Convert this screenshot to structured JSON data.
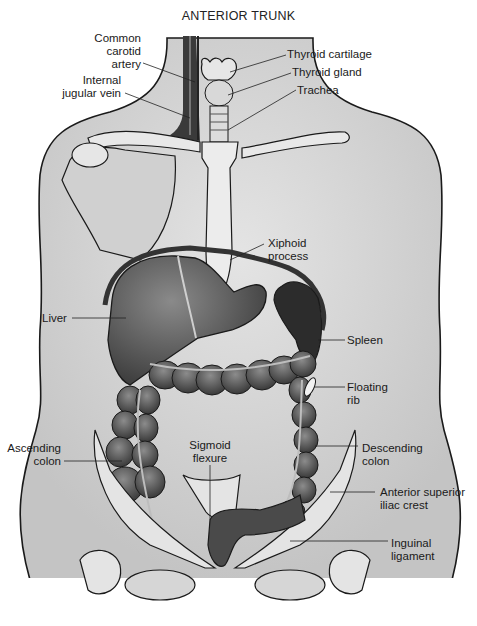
{
  "title": "ANTERIOR TRUNK",
  "labels": {
    "common_carotid_artery": "Common\ncarotid\nartery",
    "internal_jugular_vein": "Internal\njugular vein",
    "thyroid_cartilage": "Thyroid cartilage",
    "thyroid_gland": "Thyroid gland",
    "trachea": "Trachea",
    "xiphoid_process": "Xiphoid\nprocess",
    "liver": "Liver",
    "spleen": "Spleen",
    "floating_rib": "Floating\nrib",
    "ascending_colon": "Ascending\ncolon",
    "sigmoid_flexure": "Sigmoid\nflexure",
    "descending_colon": "Descending\ncolon",
    "anterior_superior_iliac_crest": "Anterior superior\niliac crest",
    "inguinal_ligament": "Inguinal\nligament"
  },
  "colors": {
    "skin": "#d4d4d4",
    "organ_dark": "#5a5a5a",
    "bone": "#e8e8e8",
    "outline": "#1a1a1a"
  }
}
